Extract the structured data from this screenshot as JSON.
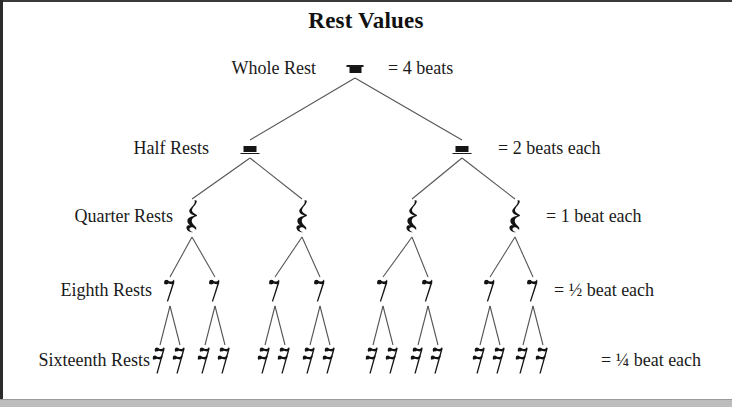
{
  "title": "Rest Values",
  "rows": [
    {
      "id": "whole",
      "label": "Whole Rest",
      "value_label": "= 4 beats",
      "glyph": "whole-rest",
      "count": 1
    },
    {
      "id": "half",
      "label": "Half Rests",
      "value_label": "= 2 beats each",
      "glyph": "half-rest",
      "count": 2
    },
    {
      "id": "quarter",
      "label": "Quarter Rests",
      "value_label": "= 1 beat  each",
      "glyph": "quarter-rest",
      "count": 4
    },
    {
      "id": "eighth",
      "label": "Eighth Rests",
      "value_label": "= ½ beat  each",
      "glyph": "eighth-rest",
      "count": 8
    },
    {
      "id": "sixteenth",
      "label": "Sixteenth Rests",
      "value_label": "= ¼ beat each",
      "glyph": "sixteenth-rest",
      "count": 16
    }
  ],
  "colors": {
    "ink": "#1a1a1a",
    "line": "#555555",
    "background": "#ffffff",
    "page_edge": "#2b2b2b"
  },
  "layout": {
    "label_right_x": 215,
    "value_left_x": 546,
    "row_y": [
      70,
      150,
      218,
      292,
      362
    ],
    "whole_x": [
      355
    ],
    "half_x": [
      250,
      462
    ],
    "quarter_x": [
      192,
      302,
      412,
      515
    ],
    "eighth_x": [
      170,
      215,
      275,
      320,
      383,
      428,
      490,
      533
    ],
    "sixteenth_x": [
      160,
      180,
      205,
      225,
      265,
      285,
      310,
      330,
      373,
      393,
      418,
      438,
      480,
      500,
      523,
      543
    ]
  }
}
